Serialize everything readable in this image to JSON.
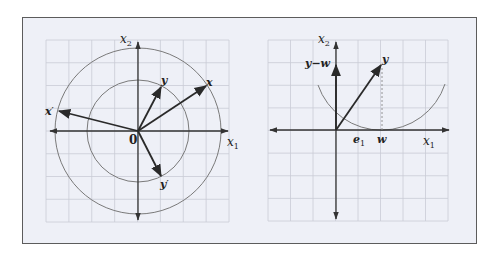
{
  "figure": {
    "left_panel": {
      "axis_labels": {
        "x1": "x",
        "x1_sub": "1",
        "x2": "x",
        "x2_sub": "2"
      },
      "origin_label": "0",
      "vectors": [
        {
          "name": "x",
          "label": "x",
          "prime": false
        },
        {
          "name": "y",
          "label": "y",
          "prime": false
        },
        {
          "name": "x-prime",
          "label": "x",
          "prime": true
        },
        {
          "name": "y-prime",
          "label": "y",
          "prime": true
        }
      ],
      "circles": [
        "inner",
        "outer"
      ]
    },
    "right_panel": {
      "axis_labels": {
        "x1": "x",
        "x1_sub": "1",
        "x2": "x",
        "x2_sub": "2"
      },
      "labels": {
        "y": "y",
        "y_minus_w": "y−w",
        "e1": "e",
        "e1_sub": "1",
        "w": "w"
      }
    },
    "colors": {
      "background": "#eef0f7",
      "grid": "#c9ccd6",
      "axis": "#333333",
      "vector": "#2a2a2a",
      "circle": "#7a7a7a",
      "frame_border": "#5c5c5c"
    }
  }
}
